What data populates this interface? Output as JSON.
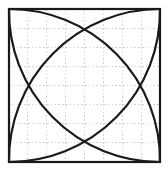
{
  "figure": {
    "title": "Square with four corner-centered quarter-circle arcs",
    "kind": "geometry-diagram",
    "background_color": "#ffffff",
    "canvas": {
      "width": 168,
      "height": 179
    }
  },
  "square": {
    "name": "bounding-square",
    "x": 9,
    "y": 9,
    "width": 151,
    "height": 153,
    "stroke_color": "#1a1a1a",
    "stroke_width": 2.2,
    "fill": "none"
  },
  "grid": {
    "visible": true,
    "style": "dashed",
    "stroke_color": "#c9c9c9",
    "stroke_width": 0.8,
    "dash_pattern": "1.6 2.2",
    "columns": 8,
    "rows": 8,
    "cell_width": 18.9,
    "cell_height": 19.1,
    "vertical_lines": [
      27.9,
      46.8,
      65.7,
      84.5,
      103.4,
      122.3,
      141.2
    ],
    "horizontal_lines": [
      28.1,
      47.2,
      66.4,
      85.5,
      104.6,
      123.8,
      142.9
    ]
  },
  "arcs": {
    "stroke_color": "#1a1a1a",
    "stroke_width": 2.2,
    "fill": "none",
    "description": "Four quarter-circle arcs, each centered on one corner of the square with radius equal to the side length, spanning between the two adjacent corners.",
    "items": [
      {
        "name": "arc-centered-top-left",
        "center_x": 9,
        "center_y": 9,
        "radius": 151,
        "start_x": 160,
        "start_y": 9,
        "end_x": 9,
        "end_y": 162,
        "sweep": 1
      },
      {
        "name": "arc-centered-top-right",
        "center_x": 160,
        "center_y": 9,
        "radius": 151,
        "start_x": 160,
        "start_y": 162,
        "end_x": 9,
        "end_y": 9,
        "sweep": 1
      },
      {
        "name": "arc-centered-bottom-right",
        "center_x": 160,
        "center_y": 162,
        "radius": 151,
        "start_x": 9,
        "start_y": 162,
        "end_x": 160,
        "end_y": 9,
        "sweep": 1
      },
      {
        "name": "arc-centered-bottom-left",
        "center_x": 9,
        "center_y": 162,
        "radius": 151,
        "start_x": 9,
        "start_y": 9,
        "end_x": 160,
        "end_y": 162,
        "sweep": 1
      }
    ]
  },
  "intersections": {
    "visible_as_markers": false,
    "points": [
      {
        "name": "intersection-top",
        "x": 84.5,
        "y": 32.0
      },
      {
        "name": "intersection-left",
        "x": 38.0,
        "y": 86.5
      },
      {
        "name": "intersection-right",
        "x": 132.0,
        "y": 86.5
      },
      {
        "name": "intersection-bottom",
        "x": 84.5,
        "y": 139.5
      }
    ]
  }
}
